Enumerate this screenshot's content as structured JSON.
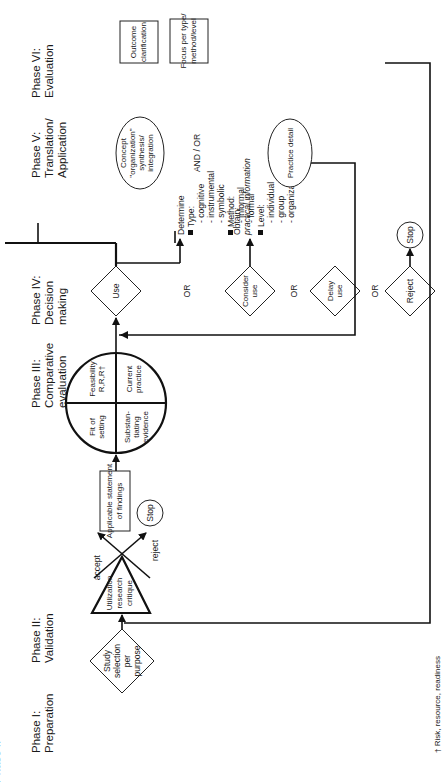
{
  "phases": [
    {
      "label_line1": "Phase I:",
      "label_line2": "Preparation"
    },
    {
      "label_line1": "Phase II:",
      "label_line2": "Validation"
    },
    {
      "label_line1": "Phase III:",
      "label_line2": "Comparative",
      "label_line3": "evaluation"
    },
    {
      "label_line1": "Phase IV:",
      "label_line2": "Decision",
      "label_line3": "making"
    },
    {
      "label_line1": "Phase V:",
      "label_line2": "Translation/",
      "label_line3": "Application"
    },
    {
      "label_line1": "Phase VI:",
      "label_line2": "Evaluation"
    }
  ],
  "phase1": {
    "diamond": [
      "Study",
      "selection",
      "per",
      "purpose"
    ]
  },
  "phase2": {
    "triangle": [
      "Utilization",
      "research",
      "critique"
    ],
    "accept": "accept",
    "reject": "reject",
    "stop": "Stop"
  },
  "phase3": {
    "findings_box": [
      "Applicable statement",
      "of findings"
    ],
    "circle": {
      "q1": [
        "Fit of",
        "setting"
      ],
      "q2": [
        "Feasibility",
        "R,R,R†"
      ],
      "q3": [
        "Substan-",
        "tiating",
        "evidence"
      ],
      "q4": [
        "Current",
        "practice"
      ]
    }
  },
  "phase4": {
    "use": "Use",
    "consider_use": [
      "Consider",
      "use"
    ],
    "delay_use": [
      "Delay",
      "use"
    ],
    "reject": "Reject",
    "stop": "Stop",
    "or": "OR"
  },
  "phase5": {
    "determine": {
      "title": "Determine",
      "type_label": "Type:",
      "types": [
        "- cognitive",
        "- instrumental",
        "- symbolic"
      ],
      "method_label": "Method:",
      "methods": [
        "- informal",
        "- formal"
      ],
      "level_label": "Level:",
      "levels": [
        "- individual",
        "- group",
        "- organization"
      ]
    },
    "obtain_practical": {
      "title": "Obtain:",
      "subtitle": "practical information",
      "items": [
        "observation",
        "evaluation",
        "consensus",
        "action \"test\""
      ]
    },
    "obtain_scientific": {
      "title": "Obtain:",
      "subtitle1": "scientific",
      "subtitle2": "information",
      "items": [
        "replication",
        "original research"
      ]
    },
    "concept_ellipse": [
      "Concept",
      "\"organization\"",
      "synthesis/",
      "integration"
    ],
    "and_or": "AND / OR",
    "practice_ellipse": "Practice detail",
    "specify": {
      "title": "Specify:",
      "process_label": "Process Components",
      "process_sub": [
        "- assmnt/ plan/",
        "intervn/ eval"
      ],
      "policy_label": [
        "Policy/ standard/",
        "Procedure/ Tool",
        "Components"
      ],
      "position_label": "Position Paper/ Rationale"
    }
  },
  "phase6": {
    "outcome_box": [
      "Outcome",
      "clarification"
    ],
    "focus_box": [
      "Focus per type/",
      "method/level"
    ],
    "informal_label": "Informal",
    "informal_items": [
      [
        "self monitoring"
      ],
      [
        "interactive",
        "assessment",
        "evaluation"
      ],
      [
        "peer",
        "discussions"
      ]
    ],
    "formal_label": "Formal",
    "formal_items": [
      [
        "case study"
      ],
      [
        "audits"
      ],
      [
        "ongoing",
        "CQI/QA"
      ]
    ]
  },
  "footnote": "† Risk, resource, readiness",
  "colors": {
    "ink": "#111111",
    "background": "#ffffff"
  }
}
